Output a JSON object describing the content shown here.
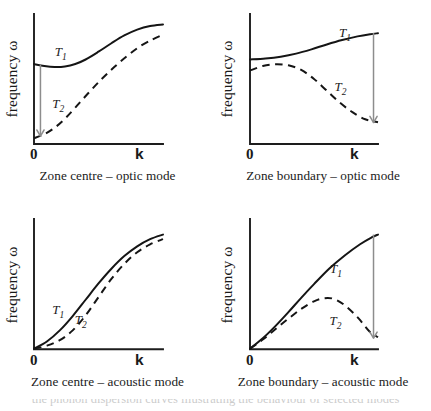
{
  "figure": {
    "axis_y_label": "frequency ω",
    "axis_x_label": "k",
    "axis_origin_label": "0",
    "series_label_1": "T",
    "series_label_1_sub": "1",
    "series_label_2": "T",
    "series_label_2_sub": "2",
    "footer_fragment": "the phonon dispersion curves illustrating the behaviour of selected modes"
  },
  "chart_data": [
    {
      "id": "zone-centre-optic",
      "type": "line",
      "title": "Zone centre – optic mode",
      "xlabel": "k",
      "ylabel": "frequency ω",
      "xlim": [
        0,
        1
      ],
      "ylim": [
        0,
        1
      ],
      "grid": false,
      "legend": "inline-labels",
      "annotation": {
        "kind": "arrow",
        "direction": "down",
        "x": 0.05,
        "y_from": 0.61,
        "y_to": 0.06,
        "color": "#8d8d8d"
      },
      "series": [
        {
          "name": "T1",
          "style": "solid",
          "label_x": 0.2,
          "label_y": 0.7,
          "x": [
            0.0,
            0.08,
            0.16,
            0.24,
            0.32,
            0.4,
            0.5,
            0.6,
            0.7,
            0.8,
            0.9,
            1.0
          ],
          "y": [
            0.615,
            0.6,
            0.592,
            0.596,
            0.615,
            0.65,
            0.71,
            0.775,
            0.835,
            0.88,
            0.908,
            0.92
          ]
        },
        {
          "name": "T2",
          "style": "dashed",
          "label_x": 0.18,
          "label_y": 0.3,
          "x": [
            0.0,
            0.08,
            0.16,
            0.24,
            0.32,
            0.42,
            0.52,
            0.62,
            0.72,
            0.82,
            0.92,
            1.0
          ],
          "y": [
            0.045,
            0.075,
            0.125,
            0.195,
            0.28,
            0.39,
            0.495,
            0.59,
            0.675,
            0.75,
            0.805,
            0.84
          ]
        }
      ]
    },
    {
      "id": "zone-boundary-optic",
      "type": "line",
      "title": "Zone boundary – optic mode",
      "xlabel": "k",
      "ylabel": "frequency ω",
      "xlim": [
        0,
        1
      ],
      "ylim": [
        0,
        1
      ],
      "grid": false,
      "legend": "inline-labels",
      "annotation": {
        "kind": "arrow",
        "direction": "down",
        "x": 0.965,
        "y_from": 0.855,
        "y_to": 0.165,
        "color": "#8d8d8d"
      },
      "series": [
        {
          "name": "T1",
          "style": "solid",
          "label_x": 0.735,
          "label_y": 0.845,
          "x": [
            0.0,
            0.12,
            0.24,
            0.36,
            0.48,
            0.6,
            0.72,
            0.84,
            0.94,
            1.0
          ],
          "y": [
            0.65,
            0.658,
            0.672,
            0.695,
            0.728,
            0.766,
            0.8,
            0.828,
            0.845,
            0.852
          ]
        },
        {
          "name": "T2",
          "style": "dashed",
          "label_x": 0.7,
          "label_y": 0.43,
          "x": [
            0.0,
            0.1,
            0.2,
            0.3,
            0.4,
            0.5,
            0.6,
            0.7,
            0.8,
            0.9,
            1.0
          ],
          "y": [
            0.565,
            0.6,
            0.614,
            0.605,
            0.57,
            0.5,
            0.41,
            0.32,
            0.245,
            0.19,
            0.168
          ]
        }
      ]
    },
    {
      "id": "zone-centre-acoustic",
      "type": "line",
      "title": "Zone centre – acoustic mode",
      "xlabel": "k",
      "ylabel": "frequency ω",
      "xlim": [
        0,
        1
      ],
      "ylim": [
        0,
        1
      ],
      "grid": false,
      "legend": "inline-labels",
      "annotation": null,
      "series": [
        {
          "name": "T1",
          "style": "solid",
          "label_x": 0.18,
          "label_y": 0.295,
          "x": [
            0.0,
            0.1,
            0.2,
            0.3,
            0.4,
            0.5,
            0.6,
            0.7,
            0.8,
            0.9,
            1.0
          ],
          "y": [
            0.005,
            0.06,
            0.145,
            0.255,
            0.38,
            0.505,
            0.618,
            0.715,
            0.79,
            0.845,
            0.88
          ]
        },
        {
          "name": "T2",
          "style": "dashed",
          "label_x": 0.355,
          "label_y": 0.225,
          "x": [
            0.0,
            0.1,
            0.2,
            0.3,
            0.4,
            0.5,
            0.6,
            0.7,
            0.8,
            0.9,
            1.0
          ],
          "y": [
            0.005,
            0.028,
            0.07,
            0.145,
            0.26,
            0.4,
            0.54,
            0.655,
            0.745,
            0.805,
            0.845
          ]
        }
      ]
    },
    {
      "id": "zone-boundary-acoustic",
      "type": "line",
      "title": "Zone boundary – acoustic mode",
      "xlabel": "k",
      "ylabel": "frequency ω",
      "xlim": [
        0,
        1
      ],
      "ylim": [
        0,
        1
      ],
      "grid": false,
      "legend": "inline-labels",
      "annotation": {
        "kind": "arrow",
        "direction": "down",
        "x": 0.965,
        "y_from": 0.88,
        "y_to": 0.085,
        "color": "#8d8d8d"
      },
      "series": [
        {
          "name": "T1",
          "style": "solid",
          "label_x": 0.665,
          "label_y": 0.61,
          "x": [
            0.0,
            0.1,
            0.2,
            0.3,
            0.4,
            0.5,
            0.62,
            0.74,
            0.86,
            0.95,
            1.0
          ],
          "y": [
            0.005,
            0.085,
            0.18,
            0.285,
            0.395,
            0.5,
            0.62,
            0.72,
            0.806,
            0.858,
            0.88
          ]
        },
        {
          "name": "T2",
          "style": "dashed",
          "label_x": 0.66,
          "label_y": 0.215,
          "x": [
            0.0,
            0.1,
            0.2,
            0.3,
            0.4,
            0.5,
            0.58,
            0.66,
            0.75,
            0.85,
            0.93,
            1.0
          ],
          "y": [
            0.005,
            0.075,
            0.155,
            0.235,
            0.31,
            0.368,
            0.392,
            0.385,
            0.33,
            0.235,
            0.14,
            0.092
          ]
        }
      ]
    }
  ]
}
